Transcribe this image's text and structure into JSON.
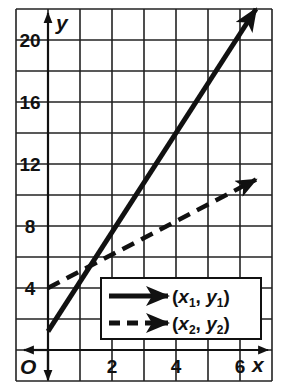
{
  "chart_data": {
    "type": "line",
    "title": "",
    "xlabel": "x",
    "ylabel": "y",
    "origin_label": "O",
    "xlim": [
      -1,
      7
    ],
    "ylim": [
      -1,
      22
    ],
    "x_ticks": [
      2,
      4,
      6
    ],
    "x_tick_labels": [
      "2",
      "4",
      "6"
    ],
    "y_ticks": [
      4,
      8,
      12,
      16,
      20
    ],
    "y_tick_labels": [
      "4",
      "8",
      "12",
      "16",
      "20"
    ],
    "grid": true,
    "grid_x_step": 1,
    "grid_y_step": 2,
    "legend_position": "lower right",
    "series": [
      {
        "name": "(x1, y1)",
        "style": "solid",
        "x": [
          0,
          6.5
        ],
        "y": [
          1.2,
          22
        ],
        "slope": 3.2,
        "intercept": 1.2
      },
      {
        "name": "(x2, y2)",
        "style": "dashed",
        "x": [
          0,
          6.5
        ],
        "y": [
          4,
          11
        ],
        "slope": 1.08,
        "intercept": 4
      }
    ]
  },
  "legend": {
    "items": [
      {
        "var_x": "x",
        "sub_x": "1",
        "var_y": "y",
        "sub_y": "1"
      },
      {
        "var_x": "x",
        "sub_x": "2",
        "var_y": "y",
        "sub_y": "2"
      }
    ]
  },
  "colors": {
    "grid": "#222222",
    "line": "#111111",
    "background": "#ffffff"
  }
}
